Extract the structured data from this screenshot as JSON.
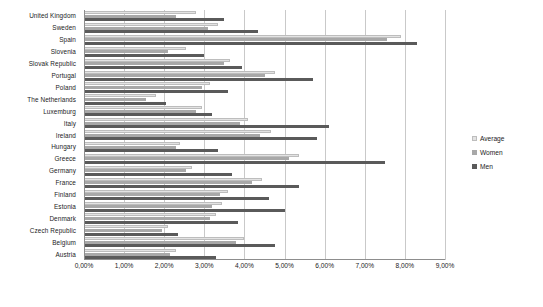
{
  "chart_data": {
    "type": "bar",
    "orientation": "horizontal",
    "title": "",
    "xlabel": "",
    "ylabel": "",
    "xlim": [
      0,
      9
    ],
    "xtick_labels": [
      "0,00%",
      "1,00%",
      "2,00%",
      "3,00%",
      "4,00%",
      "5,00%",
      "6,00%",
      "7,00%",
      "8,00%",
      "9,00%"
    ],
    "xticks": [
      0,
      1,
      2,
      3,
      4,
      5,
      6,
      7,
      8,
      9
    ],
    "grid": true,
    "legend_position": "right",
    "categories": [
      "United Kingdom",
      "Sweden",
      "Spain",
      "Slovenia",
      "Slovak Republic",
      "Portugal",
      "Poland",
      "The Netherlands",
      "Luxemburg",
      "Italy",
      "Ireland",
      "Hungary",
      "Greece",
      "Germany",
      "France",
      "Finland",
      "Estonia",
      "Denmark",
      "Czech Republic",
      "Belgium",
      "Austria"
    ],
    "series": [
      {
        "name": "Average",
        "color": "#e3e3e3",
        "values": [
          2.8,
          3.35,
          7.9,
          2.55,
          3.65,
          4.75,
          3.15,
          1.8,
          2.95,
          4.1,
          4.65,
          2.4,
          5.35,
          2.7,
          4.45,
          3.6,
          3.45,
          3.3,
          2.1,
          4.0,
          2.3
        ]
      },
      {
        "name": "Women",
        "color": "#a8a8a8",
        "values": [
          2.3,
          3.1,
          7.55,
          2.1,
          3.5,
          4.5,
          2.95,
          1.55,
          2.8,
          3.9,
          4.4,
          2.3,
          5.1,
          2.55,
          4.2,
          3.4,
          3.2,
          3.15,
          1.95,
          3.8,
          2.15
        ]
      },
      {
        "name": "Men",
        "color": "#5a5a5a",
        "values": [
          3.5,
          4.35,
          8.3,
          3.0,
          3.95,
          5.7,
          3.6,
          2.05,
          3.2,
          6.1,
          5.8,
          3.35,
          7.5,
          3.7,
          5.35,
          4.6,
          5.0,
          3.85,
          2.35,
          4.75,
          3.3
        ]
      }
    ]
  },
  "legend": {
    "items": [
      {
        "label": "Average",
        "swatch_class": "sw-avg"
      },
      {
        "label": "Women",
        "swatch_class": "sw-women"
      },
      {
        "label": "Men",
        "swatch_class": "sw-men"
      }
    ]
  },
  "caption": {
    "text": ""
  }
}
